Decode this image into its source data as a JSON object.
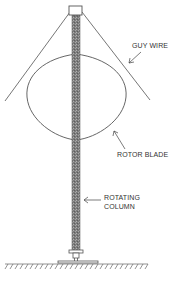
{
  "diagram": {
    "type": "wind-turbine-schematic",
    "labels": {
      "guy_wire": "GUY WIRE",
      "rotor_blade": "ROTOR BLADE",
      "rotating_column_line1": "ROTATING",
      "rotating_column_line2": "COLUMN"
    },
    "colors": {
      "line": "#555555",
      "column_fill": "#8a8a8a",
      "background": "#ffffff"
    }
  }
}
